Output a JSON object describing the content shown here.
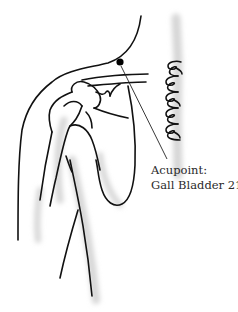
{
  "figure": {
    "label": {
      "line1": "Acupoint:",
      "line2": "Gall Bladder 21"
    },
    "colors": {
      "ink": "#111111",
      "shade": "#d8d8d8",
      "label_text": "#2a2a2a",
      "background": "#ffffff"
    },
    "marker": {
      "x": 120,
      "y": 62,
      "r": 3.5
    },
    "leader_line": {
      "x1": 121,
      "y1": 66,
      "x2": 167,
      "y2": 159
    }
  }
}
